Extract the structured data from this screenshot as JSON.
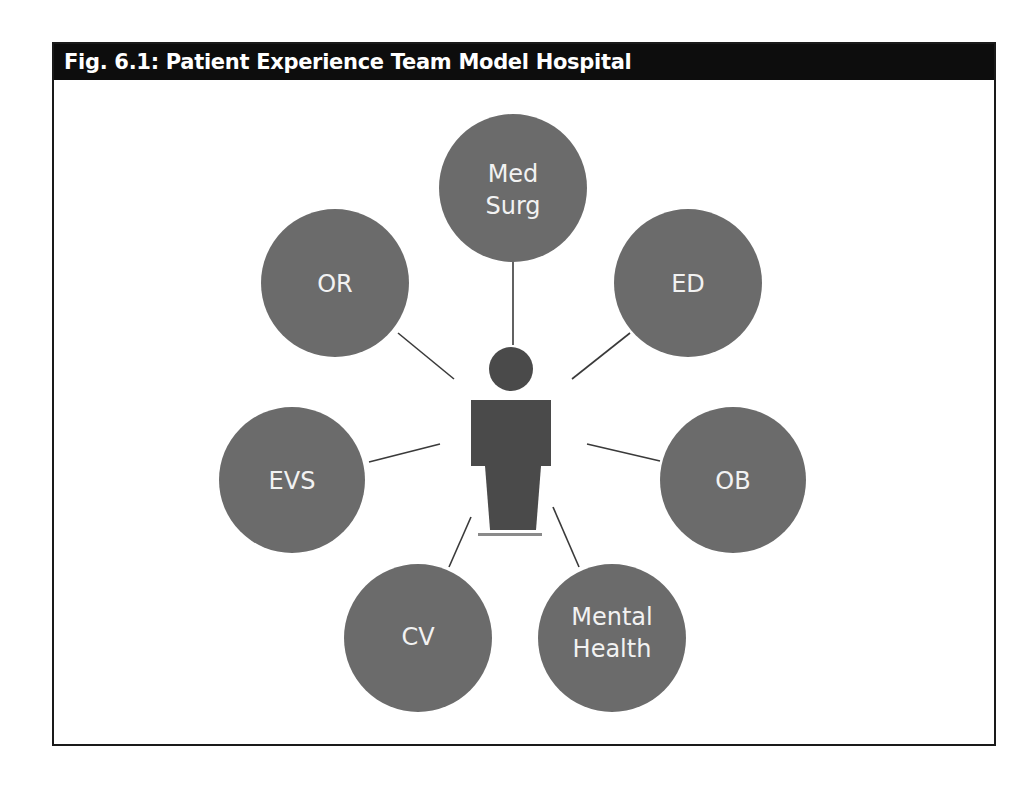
{
  "figure": {
    "title": "Fig. 6.1: Patient Experience Team Model Hospital"
  },
  "center": {
    "label": "",
    "icon": "person-icon"
  },
  "nodes": [
    {
      "id": "med-surg",
      "lines": [
        "Med",
        "Surg"
      ]
    },
    {
      "id": "ed",
      "lines": [
        "ED"
      ]
    },
    {
      "id": "ob",
      "lines": [
        "OB"
      ]
    },
    {
      "id": "mental-health",
      "lines": [
        "Mental",
        "Health"
      ]
    },
    {
      "id": "cv",
      "lines": [
        "CV"
      ]
    },
    {
      "id": "evs",
      "lines": [
        "EVS"
      ]
    },
    {
      "id": "or",
      "lines": [
        "OR"
      ]
    }
  ],
  "colors": {
    "header_bg": "#0d0d0d",
    "node_fill": "#6b6b6b",
    "person_fill": "#4a4a4a",
    "connector": "#3a3a3a",
    "label_text": "#f2f2f2"
  }
}
